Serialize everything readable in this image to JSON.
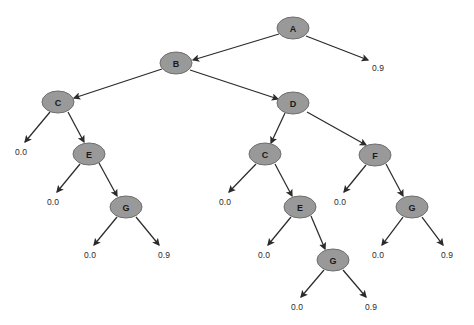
{
  "diagram": {
    "type": "tree",
    "background_color": "#ffffff",
    "node_fill_color": "#999999",
    "node_stroke_color": "#6e6e6e",
    "edge_color": "#2b2b2b",
    "node_label_color": "#1a1a1a",
    "leaf_label_color": "#2b2b2b",
    "node_radius_x": 16,
    "node_radius_y": 11
  },
  "nodes": [
    {
      "id": "n0",
      "label": "A",
      "x": 293,
      "y": 28
    },
    {
      "id": "n1",
      "label": "B",
      "x": 176,
      "y": 63
    },
    {
      "id": "n2",
      "label": "C",
      "x": 58,
      "y": 102
    },
    {
      "id": "n3",
      "label": "D",
      "x": 293,
      "y": 103
    },
    {
      "id": "n4",
      "label": "E",
      "x": 89,
      "y": 154
    },
    {
      "id": "n5",
      "label": "G",
      "x": 126,
      "y": 207
    },
    {
      "id": "n6",
      "label": "C",
      "x": 265,
      "y": 154
    },
    {
      "id": "n7",
      "label": "F",
      "x": 375,
      "y": 155
    },
    {
      "id": "n8",
      "label": "E",
      "x": 300,
      "y": 207
    },
    {
      "id": "n9",
      "label": "G",
      "x": 412,
      "y": 207
    },
    {
      "id": "n10",
      "label": "G",
      "x": 333,
      "y": 260
    }
  ],
  "leaves": [
    {
      "id": "l0",
      "label": "0.9",
      "x": 378,
      "y": 68
    },
    {
      "id": "l1",
      "label": "0.0",
      "x": 21,
      "y": 152
    },
    {
      "id": "l2",
      "label": "0.0",
      "x": 53,
      "y": 202
    },
    {
      "id": "l3",
      "label": "0.0",
      "x": 90,
      "y": 255
    },
    {
      "id": "l4",
      "label": "0.9",
      "x": 164,
      "y": 255
    },
    {
      "id": "l5",
      "label": "0.0",
      "x": 225,
      "y": 202
    },
    {
      "id": "l6",
      "label": "0.0",
      "x": 264,
      "y": 255
    },
    {
      "id": "l7",
      "label": "0.0",
      "x": 340,
      "y": 202
    },
    {
      "id": "l8",
      "label": "0.0",
      "x": 378,
      "y": 255
    },
    {
      "id": "l9",
      "label": "0.9",
      "x": 447,
      "y": 255
    },
    {
      "id": "l10",
      "label": "0.0",
      "x": 297,
      "y": 307
    },
    {
      "id": "l11",
      "label": "0.9",
      "x": 371,
      "y": 307
    }
  ],
  "edges": [
    {
      "from": "n0",
      "to": "n1",
      "x1": 279,
      "y1": 34,
      "x2": 193,
      "y2": 60
    },
    {
      "from": "n0",
      "to": "l0",
      "x1": 306,
      "y1": 36,
      "x2": 368,
      "y2": 60
    },
    {
      "from": "n1",
      "to": "n2",
      "x1": 162,
      "y1": 69,
      "x2": 74,
      "y2": 98
    },
    {
      "from": "n1",
      "to": "n3",
      "x1": 190,
      "y1": 70,
      "x2": 278,
      "y2": 99
    },
    {
      "from": "n2",
      "to": "l1",
      "x1": 50,
      "y1": 112,
      "x2": 25,
      "y2": 142
    },
    {
      "from": "n2",
      "to": "n4",
      "x1": 68,
      "y1": 112,
      "x2": 84,
      "y2": 142
    },
    {
      "from": "n4",
      "to": "l2",
      "x1": 80,
      "y1": 164,
      "x2": 57,
      "y2": 192
    },
    {
      "from": "n4",
      "to": "n5",
      "x1": 99,
      "y1": 163,
      "x2": 117,
      "y2": 196
    },
    {
      "from": "n5",
      "to": "l3",
      "x1": 117,
      "y1": 217,
      "x2": 94,
      "y2": 245
    },
    {
      "from": "n5",
      "to": "l4",
      "x1": 136,
      "y1": 217,
      "x2": 159,
      "y2": 245
    },
    {
      "from": "n3",
      "to": "n6",
      "x1": 285,
      "y1": 113,
      "x2": 271,
      "y2": 143
    },
    {
      "from": "n3",
      "to": "n7",
      "x1": 307,
      "y1": 112,
      "x2": 366,
      "y2": 145
    },
    {
      "from": "n6",
      "to": "l5",
      "x1": 256,
      "y1": 164,
      "x2": 229,
      "y2": 192
    },
    {
      "from": "n6",
      "to": "n8",
      "x1": 275,
      "y1": 164,
      "x2": 292,
      "y2": 196
    },
    {
      "from": "n8",
      "to": "l6",
      "x1": 291,
      "y1": 217,
      "x2": 268,
      "y2": 245
    },
    {
      "from": "n8",
      "to": "n10",
      "x1": 311,
      "y1": 216,
      "x2": 325,
      "y2": 249
    },
    {
      "from": "n10",
      "to": "l10",
      "x1": 324,
      "y1": 270,
      "x2": 301,
      "y2": 297
    },
    {
      "from": "n10",
      "to": "l11",
      "x1": 343,
      "y1": 270,
      "x2": 366,
      "y2": 297
    },
    {
      "from": "n7",
      "to": "l7",
      "x1": 366,
      "y1": 165,
      "x2": 344,
      "y2": 192
    },
    {
      "from": "n7",
      "to": "n9",
      "x1": 386,
      "y1": 164,
      "x2": 403,
      "y2": 196
    },
    {
      "from": "n9",
      "to": "l8",
      "x1": 403,
      "y1": 217,
      "x2": 382,
      "y2": 245
    },
    {
      "from": "n9",
      "to": "l9",
      "x1": 422,
      "y1": 217,
      "x2": 443,
      "y2": 245
    }
  ]
}
